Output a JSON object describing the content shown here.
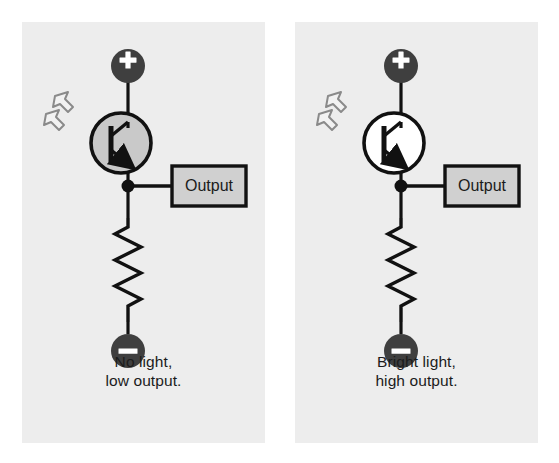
{
  "figure": {
    "type": "circuit-diagram",
    "background_color": "#ffffff",
    "panel_background_color": "#ededed"
  },
  "colors": {
    "panel_bg": "#ededed",
    "page_bg": "#ffffff",
    "wire": "#111111",
    "terminal_fill": "#3f3f3f",
    "terminal_glyph": "#ffffff",
    "transistor_off_fill": "#c9c9c9",
    "transistor_on_fill": "#ffffff",
    "output_box_fill": "#d0d0d0",
    "output_box_border": "#111111",
    "light_arrow_fill": "#f2f2f2",
    "light_arrow_stroke": "#8a8a8a",
    "text": "#1b1b1b"
  },
  "panels": [
    {
      "id": "no-light",
      "position": "left",
      "caption_line1": "No light,",
      "caption_line2": "low output.",
      "transistor_state": "off",
      "transistor_fill": "#c9c9c9",
      "components": {
        "positive_terminal_label": "+",
        "negative_terminal_label": "−",
        "output_label": "Output",
        "transistor_name": "phototransistor",
        "resistor_name": "resistor",
        "light_arrows_count": 2
      }
    },
    {
      "id": "bright-light",
      "position": "right",
      "caption_line1": "Bright light,",
      "caption_line2": "high output.",
      "transistor_state": "on",
      "transistor_fill": "#ffffff",
      "components": {
        "positive_terminal_label": "+",
        "negative_terminal_label": "−",
        "output_label": "Output",
        "transistor_name": "phototransistor",
        "resistor_name": "resistor",
        "light_arrows_count": 2
      }
    }
  ]
}
